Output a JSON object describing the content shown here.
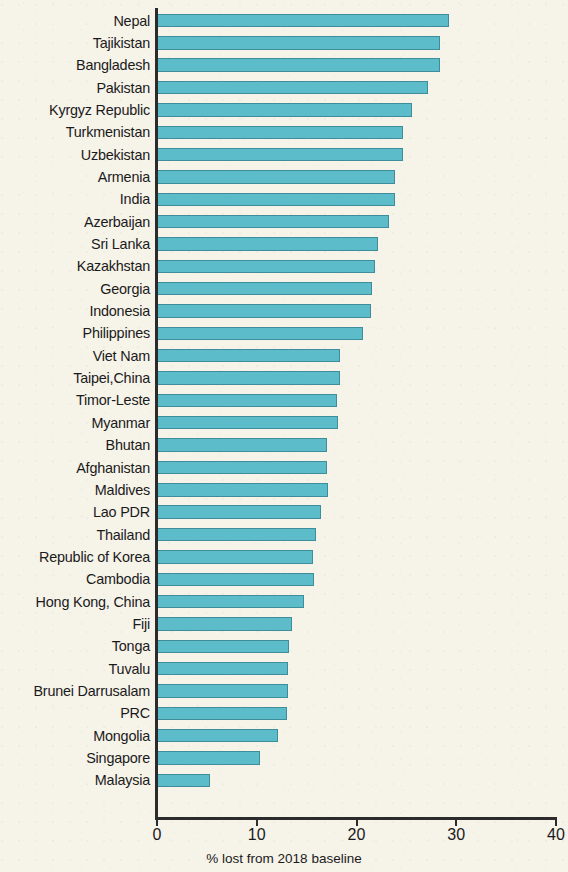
{
  "chart_data": {
    "type": "bar",
    "orientation": "horizontal",
    "title": "",
    "subtitle": "",
    "xlabel": "% lost from 2018 baseline",
    "ylabel": "",
    "xlim": [
      0,
      40
    ],
    "xticks": [
      0,
      10,
      20,
      30,
      40
    ],
    "xtick_labels": [
      "0",
      "10",
      "20",
      "30",
      "40"
    ],
    "grid": false,
    "legend": null,
    "bar_color": "#5cbcca",
    "bar_edge_color": "#3d8d9b",
    "background_color": "#f6f3e9",
    "categories": [
      "Nepal",
      "Tajikistan",
      "Bangladesh",
      "Pakistan",
      "Kyrgyz Republic",
      "Turkmenistan",
      "Uzbekistan",
      "Armenia",
      "India",
      "Azerbaijan",
      "Sri Lanka",
      "Kazakhstan",
      "Georgia",
      "Indonesia",
      "Philippines",
      "Viet Nam",
      "Taipei,China",
      "Timor-Leste",
      "Myanmar",
      "Bhutan",
      "Afghanistan",
      "Maldives",
      "Lao PDR",
      "Thailand",
      "Republic of Korea",
      "Cambodia",
      "Hong Kong, China",
      "Fiji",
      "Tonga",
      "Tuvalu",
      "Brunei Darrusalam",
      "PRC",
      "Mongolia",
      "Singapore",
      "Malaysia"
    ],
    "values": [
      29.3,
      28.4,
      28.4,
      27.2,
      25.6,
      24.7,
      24.7,
      23.9,
      23.9,
      23.3,
      22.2,
      21.9,
      21.6,
      21.5,
      20.7,
      18.3,
      18.3,
      18.0,
      18.1,
      17.0,
      17.0,
      17.1,
      16.4,
      15.9,
      15.6,
      15.7,
      14.7,
      13.5,
      13.2,
      13.1,
      13.1,
      13.0,
      12.1,
      10.3,
      5.3
    ]
  }
}
